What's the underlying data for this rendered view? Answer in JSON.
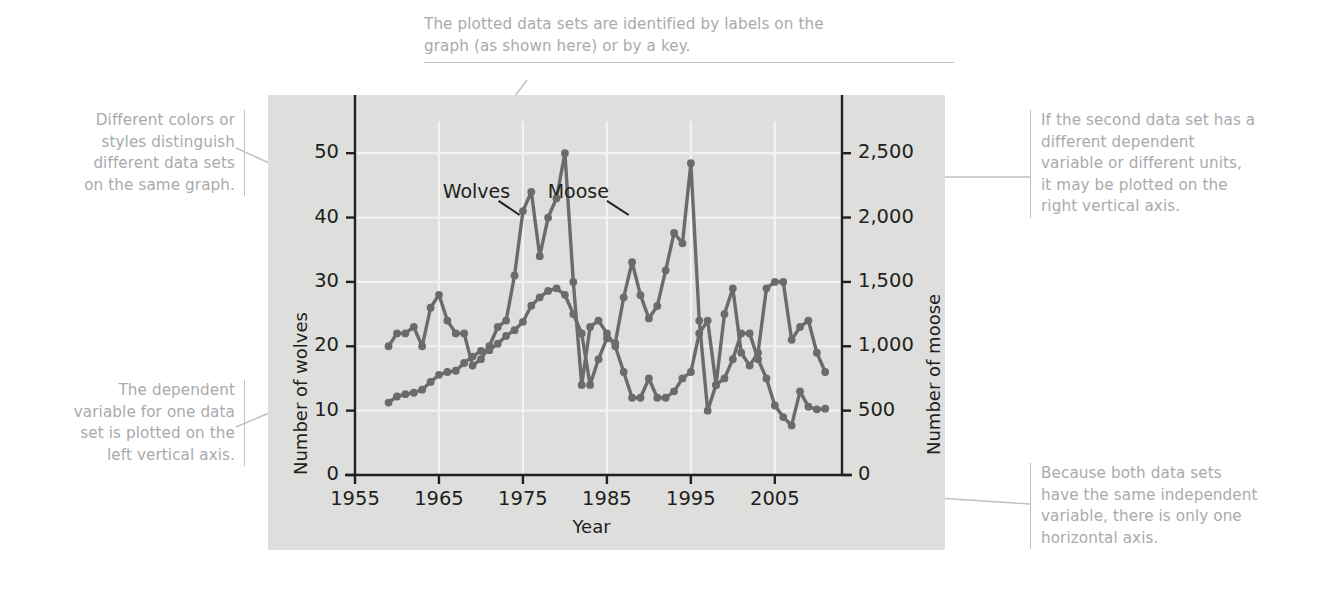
{
  "figure": {
    "kind": "annotated-line-graph",
    "panel_color": "#dededd",
    "series_color": "#6b6b6b",
    "grid_color": "#f2f2f1",
    "callout_color": "#a9aaac",
    "axis_color": "#231f20"
  },
  "callouts": {
    "top": "The plotted data sets are identified by labels on the\ngraph (as shown here) or by a key.",
    "left_top": "Different colors or\nstyles distinguish\ndifferent data sets\non the same graph.",
    "left_bottom": "The dependent\nvariable for one data\nset is plotted on the\nleft vertical axis.",
    "right_top": "If the second data set has a\ndifferent dependent\nvariable or different units,\nit may be plotted on the\nright vertical axis.",
    "right_bottom": "Because both data sets\nhave the same independent\nvariable, there is only one\nhorizontal axis."
  },
  "chart_data": {
    "type": "line",
    "title": "",
    "xlabel": "Year",
    "ylabel": "Number of wolves",
    "y2label": "Number of moose",
    "xlim": [
      1955,
      2013
    ],
    "ylim": [
      0,
      55
    ],
    "y2lim": [
      0,
      2750
    ],
    "xticks": [
      1955,
      1965,
      1975,
      1985,
      1995,
      2005
    ],
    "xticklabels": [
      "1955",
      "1965",
      "1975",
      "1985",
      "1995",
      "2005"
    ],
    "yticks": [
      0,
      10,
      20,
      30,
      40,
      50
    ],
    "yticklabels": [
      "0",
      "10",
      "20",
      "30",
      "40",
      "50"
    ],
    "y2ticks": [
      0,
      500,
      1000,
      1500,
      2000,
      2500
    ],
    "y2ticklabels": [
      "0",
      "500",
      "1,000",
      "1,500",
      "2,000",
      "2,500"
    ],
    "grid": true,
    "legend": "inline-labels",
    "inline_labels": [
      {
        "text": "Wolves",
        "x": 1969.5,
        "y": 44.0
      },
      {
        "text": "Moose",
        "x": 1982.0,
        "y": 44.0
      }
    ],
    "x": [
      1959,
      1960,
      1961,
      1962,
      1963,
      1964,
      1965,
      1966,
      1967,
      1968,
      1969,
      1970,
      1971,
      1972,
      1973,
      1974,
      1975,
      1976,
      1977,
      1978,
      1979,
      1980,
      1981,
      1982,
      1983,
      1984,
      1985,
      1986,
      1987,
      1988,
      1989,
      1990,
      1991,
      1992,
      1993,
      1994,
      1995,
      1996,
      1997,
      1998,
      1999,
      2000,
      2001,
      2002,
      2003,
      2004,
      2005,
      2006,
      2007,
      2008,
      2009,
      2010,
      2011
    ],
    "series": [
      {
        "name": "Wolves",
        "axis": "left",
        "units": "count",
        "values": [
          20,
          22,
          22,
          23,
          20,
          26,
          28,
          24,
          22,
          22,
          17,
          18,
          20,
          23,
          24,
          31,
          41,
          44,
          34,
          40,
          43,
          50,
          30,
          14,
          23,
          24,
          22,
          20,
          16,
          12,
          12,
          15,
          12,
          12,
          13,
          15,
          16,
          22,
          24,
          14,
          25,
          29,
          19,
          17,
          19,
          29,
          30,
          30,
          21,
          23,
          24,
          19,
          16
        ]
      },
      {
        "name": "Moose",
        "axis": "right",
        "units": "count",
        "values": [
          563,
          610,
          628,
          639,
          663,
          723,
          778,
          800,
          810,
          870,
          920,
          965,
          970,
          1020,
          1080,
          1125,
          1190,
          1315,
          1380,
          1430,
          1450,
          1400,
          1250,
          1100,
          700,
          900,
          1062,
          1025,
          1380,
          1653,
          1397,
          1216,
          1313,
          1590,
          1880,
          1800,
          2422,
          1200,
          500,
          700,
          750,
          900,
          1100,
          1100,
          900,
          750,
          540,
          450,
          385,
          650,
          530,
          510,
          515
        ]
      }
    ]
  }
}
